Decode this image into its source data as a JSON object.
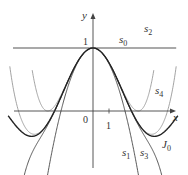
{
  "diagram": {
    "title": "",
    "axes": {
      "x_label": "x",
      "y_label": "y",
      "origin_label": "0",
      "x_tick_label": "1",
      "y_tick_label": "1"
    },
    "curves": [
      {
        "id": "s0",
        "label": "s",
        "sub": "0",
        "formula": "1",
        "color": "#555555",
        "width": 1.1
      },
      {
        "id": "s1",
        "label": "s",
        "sub": "1",
        "formula": "1 - x^2/4",
        "color": "#444444",
        "width": 0.9
      },
      {
        "id": "s2",
        "label": "s",
        "sub": "2",
        "formula": "1 - x^2/4 + x^4/64",
        "color": "#999999",
        "width": 0.9
      },
      {
        "id": "s3",
        "label": "s",
        "sub": "3",
        "formula": "1 - x^2/4 + x^4/64 - x^6/2304",
        "color": "#444444",
        "width": 0.9
      },
      {
        "id": "s4",
        "label": "s",
        "sub": "4",
        "formula": "1 - x^2/4 + x^4/64 - x^6/2304 + x^8/147456",
        "color": "#999999",
        "width": 0.9
      },
      {
        "id": "J0",
        "label": "J",
        "sub": "0",
        "formula": "Bessel J0(x)",
        "color": "#222222",
        "width": 1.4
      }
    ]
  }
}
